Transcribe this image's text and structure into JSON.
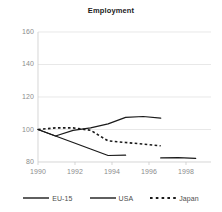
{
  "chart_data": {
    "type": "line",
    "title": "Employment",
    "xlabel": "",
    "ylabel": "",
    "xlim": [
      1990,
      1999.5
    ],
    "ylim": [
      80,
      160
    ],
    "grid": true,
    "grid_axis": "y",
    "legend_position": "bottom",
    "x": [
      1990,
      1991,
      1992,
      1993,
      1994,
      1995,
      1996,
      1997,
      1998,
      1999
    ],
    "xticks": [
      1990,
      1992,
      1994,
      1996,
      1998
    ],
    "xtick_labels": [
      "1990",
      "1992",
      "1994",
      "1996",
      "1998"
    ],
    "yticks": [
      80,
      100,
      120,
      140,
      160
    ],
    "ytick_labels": [
      "80",
      "100",
      "120",
      "140",
      "160"
    ],
    "series": [
      {
        "name": "EU-15",
        "style": "solid",
        "color": "#1a1a1a",
        "x": [
          1990,
          1991,
          1992,
          1993,
          1994,
          1995,
          1996,
          1997
        ],
        "values": [
          100,
          96,
          99.5,
          101,
          103.5,
          107.5,
          108,
          107
        ]
      },
      {
        "name": "USA",
        "style": "solid",
        "color": "#1a1a1a",
        "x": [
          1990,
          1991,
          1992,
          1993,
          1994,
          1995,
          1997,
          1998,
          1999
        ],
        "values": [
          100,
          96,
          92,
          88,
          84,
          84.2,
          82.5,
          82.7,
          82.3
        ],
        "gap_after": 1995
      },
      {
        "name": "Japan",
        "style": "dotted",
        "color": "#1a1a1a",
        "x": [
          1990,
          1991,
          1992,
          1993,
          1994,
          1995,
          1996,
          1997
        ],
        "values": [
          100,
          101,
          101,
          99.5,
          93,
          92,
          91,
          90
        ]
      }
    ]
  },
  "chart": {
    "title": "Employment",
    "yticks": [
      {
        "label": "160",
        "top": 28
      },
      {
        "label": "140",
        "top": 60
      },
      {
        "label": "120",
        "top": 93
      },
      {
        "label": "100",
        "top": 126
      },
      {
        "label": "80",
        "top": 158
      }
    ],
    "xticks": [
      {
        "label": "1990",
        "left": 21
      },
      {
        "label": "1992",
        "left": 58
      },
      {
        "label": "1994",
        "left": 95
      },
      {
        "label": "1996",
        "left": 132
      },
      {
        "label": "1998",
        "left": 169
      }
    ]
  },
  "legend": {
    "items": [
      {
        "label": "EU-15",
        "style": "solid"
      },
      {
        "label": "USA",
        "style": "solid"
      },
      {
        "label": "Japan",
        "style": "dotted"
      }
    ]
  }
}
